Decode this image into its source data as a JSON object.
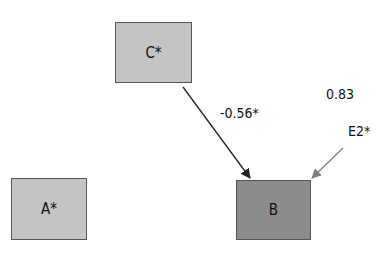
{
  "diagram": {
    "type": "path-diagram",
    "nodes": [
      {
        "id": "C",
        "label": "C*",
        "fill": "#c4c4c4"
      },
      {
        "id": "A",
        "label": "A*",
        "fill": "#c4c4c4"
      },
      {
        "id": "B",
        "label": "B",
        "fill": "#8c8c8c"
      }
    ],
    "edges": [
      {
        "from": "C",
        "to": "B",
        "label": "-0.56*",
        "color": "#222222"
      },
      {
        "from": "E2",
        "to": "B",
        "label": "",
        "color": "#808080"
      }
    ],
    "error_term": {
      "label": "E2*",
      "variance": "0.83"
    }
  }
}
